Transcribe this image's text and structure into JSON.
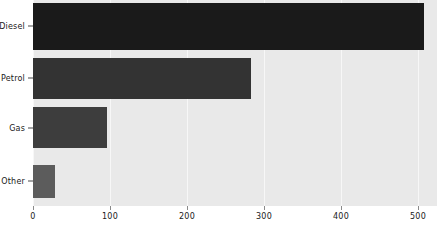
{
  "chart_data": {
    "type": "bar",
    "orientation": "horizontal",
    "title": "",
    "xlabel": "",
    "ylabel": "",
    "categories": [
      "Diesel",
      "Petrol",
      "Gas",
      "Other"
    ],
    "values": [
      508,
      283,
      96,
      29
    ],
    "xlim": [
      0,
      525
    ],
    "ylim": [
      0,
      4
    ],
    "xticks": [
      0,
      100,
      200,
      300,
      400,
      500
    ],
    "xticklabels": [
      "0",
      "100",
      "200",
      "300",
      "400",
      "500"
    ],
    "grid": true,
    "grid_axis": "x",
    "legend": false,
    "bar_colors": [
      "#1a1a1a",
      "#333333",
      "#3d3d3d",
      "#5c5c5c"
    ],
    "plot_background": "#e9e9e9",
    "figure_background": "#ffffff",
    "gridline_color": "#f7f7f7",
    "tick_color": "#8a8a8a",
    "text_color": "#202020"
  }
}
